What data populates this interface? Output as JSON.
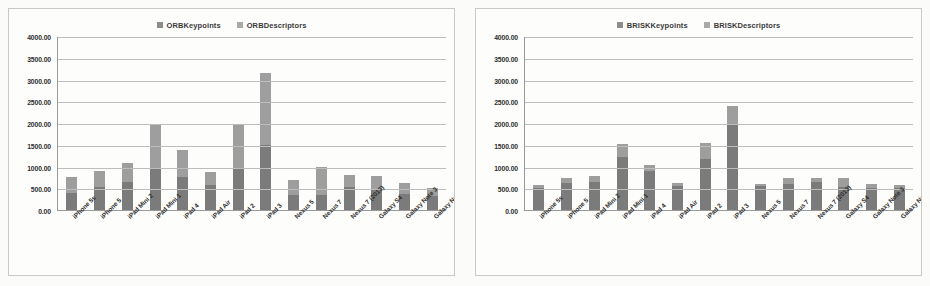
{
  "chart_data": [
    {
      "type": "bar",
      "title": "",
      "stacked": true,
      "xlabel": "",
      "ylabel": "",
      "ylim": [
        0,
        4000
      ],
      "ytick_step": 500,
      "ytick_labels": [
        "0.00",
        "500.00",
        "1000.00",
        "1500.00",
        "2000.00",
        "2500.00",
        "3000.00",
        "3500.00",
        "4000.00"
      ],
      "grid": true,
      "legend_position": "top-center",
      "categories": [
        "iPhone 5s",
        "iPhone 5",
        "iPad Mini 2",
        "iPad Mini 1",
        "iPad 4",
        "iPad Air",
        "iPad 2",
        "iPad 3",
        "Nexus 5",
        "Nexus 7",
        "Nexus 7 (2013)",
        "Galaxy S4",
        "Galaxy Note 3",
        "Galaxy Note 10.1"
      ],
      "series": [
        {
          "name": "ORBKeypoints",
          "color": "#7b7b7b",
          "values": [
            380,
            520,
            650,
            950,
            760,
            580,
            950,
            1500,
            340,
            340,
            540,
            460,
            360,
            330
          ]
        },
        {
          "name": "ORBDescriptors",
          "color": "#9e9e9e",
          "values": [
            380,
            370,
            420,
            1010,
            620,
            300,
            1000,
            1650,
            340,
            660,
            270,
            330,
            250,
            180
          ]
        }
      ],
      "totals": [
        760,
        890,
        1070,
        1960,
        1380,
        880,
        1950,
        3150,
        680,
        1000,
        810,
        790,
        610,
        510
      ]
    },
    {
      "type": "bar",
      "title": "",
      "stacked": true,
      "xlabel": "",
      "ylabel": "",
      "ylim": [
        0,
        4000
      ],
      "ytick_step": 500,
      "ytick_labels": [
        "0.00",
        "500.00",
        "1000.00",
        "1500.00",
        "2000.00",
        "2500.00",
        "3000.00",
        "3500.00",
        "4000.00"
      ],
      "grid": true,
      "legend_position": "top-center",
      "categories": [
        "iPhone 5s",
        "iPhone 5",
        "iPad Mini 2",
        "iPad Mini 1",
        "iPad 4",
        "iPad Air",
        "iPad 2",
        "iPad 3",
        "Nexus 5",
        "Nexus 7",
        "Nexus 7 (2013)",
        "Galaxy S4",
        "Galaxy Note 3",
        "Galaxy Note 10.1"
      ],
      "series": [
        {
          "name": "BRISKKeypoints",
          "color": "#7b7b7b",
          "values": [
            500,
            620,
            640,
            1220,
            900,
            560,
            1180,
            1950,
            560,
            600,
            640,
            540,
            510,
            500
          ]
        },
        {
          "name": "BRISKDescriptors",
          "color": "#9e9e9e",
          "values": [
            80,
            110,
            140,
            290,
            140,
            60,
            350,
            450,
            40,
            130,
            100,
            190,
            90,
            70
          ]
        }
      ],
      "totals": [
        580,
        730,
        780,
        1510,
        1040,
        620,
        1530,
        2400,
        600,
        730,
        740,
        730,
        600,
        570
      ]
    }
  ],
  "charts": [
    {
      "id": "orb",
      "legend": [
        {
          "label": "ORBKeypoints",
          "swatch": "legend-swatch-dark"
        },
        {
          "label": "ORBDescriptors",
          "swatch": "legend-swatch-light"
        }
      ]
    },
    {
      "id": "brisk",
      "legend": [
        {
          "label": "BRISKKeypoints",
          "swatch": "legend-swatch-dark"
        },
        {
          "label": "BRISKDescriptors",
          "swatch": "legend-swatch-light"
        }
      ]
    }
  ],
  "colors": {
    "keypoints": "#7b7b7b",
    "descriptors": "#9e9e9e",
    "gridline": "#bdbdbd",
    "axis": "#9a9a9a",
    "card_border": "#c9c9c5",
    "background": "#fbfbfa",
    "text": "#2f2f2f"
  }
}
